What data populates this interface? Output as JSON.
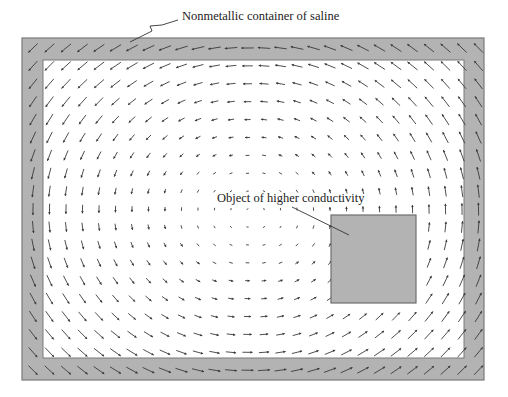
{
  "figure": {
    "width": 508,
    "height": 397,
    "colors": {
      "frame_fill": "#b3b3b3",
      "frame_stroke": "#7a7a7a",
      "inner_fill": "#ffffff",
      "object_fill": "#b3b3b3",
      "object_stroke": "#6e6e6e",
      "arrow": "#3a3a3a",
      "leader": "#333333"
    },
    "container": {
      "outer": {
        "x": 22,
        "y": 38,
        "w": 462,
        "h": 342
      },
      "inner": {
        "x": 43,
        "y": 60,
        "w": 421,
        "h": 298
      }
    },
    "object": {
      "x": 331,
      "y": 215,
      "w": 85,
      "h": 88
    },
    "grid": {
      "x0": 33,
      "dx": 16.5,
      "cols": 28,
      "y0": 48,
      "dy": 17.9,
      "rows": 19
    },
    "vortex": {
      "cx": 250,
      "cy": 212,
      "direction": "counterclockwise"
    }
  },
  "labels": {
    "container": {
      "text": "Nonmetallic container of saline",
      "x": 182,
      "y": 9,
      "leader": [
        [
          130,
          42
        ],
        [
          152,
          31
        ],
        [
          150,
          26
        ],
        [
          162,
          25
        ],
        [
          178,
          20
        ]
      ]
    },
    "object": {
      "text": "Object of higher conductivity",
      "x": 217,
      "y": 191,
      "leader": [
        [
          292,
          207
        ],
        [
          349,
          235
        ]
      ]
    }
  }
}
